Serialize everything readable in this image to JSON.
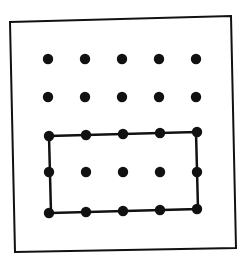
{
  "diagram": {
    "type": "geoboard",
    "colors": {
      "background": "#ffffff",
      "ink": "#111111"
    },
    "frame": {
      "points": [
        [
          10,
          22
        ],
        [
          231,
          16
        ],
        [
          236,
          248
        ],
        [
          15,
          252
        ]
      ],
      "stroke_width": 2
    },
    "grid": {
      "columns": [
        48,
        85,
        122,
        159,
        196
      ],
      "rows": [
        59,
        97,
        135,
        172,
        211
      ],
      "dot_radius": 5.2
    },
    "rectangle": {
      "description": "Rectangle enclosing bottom three rows of dots (4 units wide by 2 units tall)",
      "points": [
        [
          49,
          136
        ],
        [
          196,
          132
        ],
        [
          198,
          209
        ],
        [
          51,
          213
        ]
      ],
      "stroke_width": 2.5
    }
  }
}
